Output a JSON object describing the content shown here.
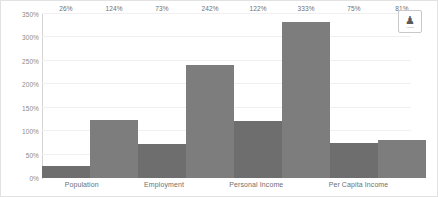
{
  "chart_data": {
    "type": "bar",
    "title": "",
    "subtitle": "",
    "xlabel": "",
    "ylabel": "",
    "categories": [
      "Population",
      "Employment",
      "Personal Income",
      "Per Capita Income"
    ],
    "series": [
      {
        "name": "Series 1",
        "values": [
          26,
          73,
          122,
          75
        ],
        "color": "#6e6e6e"
      },
      {
        "name": "Series 2",
        "values": [
          124,
          242,
          333,
          81
        ],
        "color": "#7d7d7d"
      }
    ],
    "value_labels": [
      [
        "26%",
        "124%"
      ],
      [
        "73%",
        "242%"
      ],
      [
        "122%",
        "333%"
      ],
      [
        "75%",
        "81%"
      ]
    ],
    "ylim": [
      0,
      350
    ],
    "ytick_values": [
      0,
      50,
      100,
      150,
      200,
      250,
      300,
      350
    ],
    "ytick_labels": [
      "0%",
      "50%",
      "100%",
      "150%",
      "200%",
      "250%",
      "300%",
      "350%"
    ],
    "grid": true,
    "legend": "none",
    "grid_color": "#f0f0f0",
    "axis_color": "#d4d4d4",
    "tick_label_color": "#8a8a8a"
  },
  "badge": {
    "emblem": "♟",
    "caption": "LOGO"
  }
}
